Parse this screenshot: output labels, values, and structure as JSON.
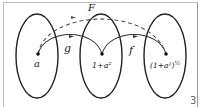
{
  "diagram": {
    "sets": [
      {
        "id": "domain",
        "point_label": "a"
      },
      {
        "id": "middle",
        "point_label": "1+a²"
      },
      {
        "id": "codomain",
        "point_label": "(1+a²)",
        "point_label_exp": "½"
      }
    ],
    "maps": [
      {
        "label": "g",
        "from": "domain",
        "to": "middle",
        "style": "solid"
      },
      {
        "label": "f",
        "from": "middle",
        "to": "codomain",
        "style": "solid"
      },
      {
        "label": "F",
        "from": "domain",
        "to": "codomain",
        "style": "dashed"
      }
    ],
    "figure_number": "3",
    "colors": {
      "stroke": "#222222",
      "dashed": "#555555",
      "frame": "#bdbdbd"
    }
  }
}
